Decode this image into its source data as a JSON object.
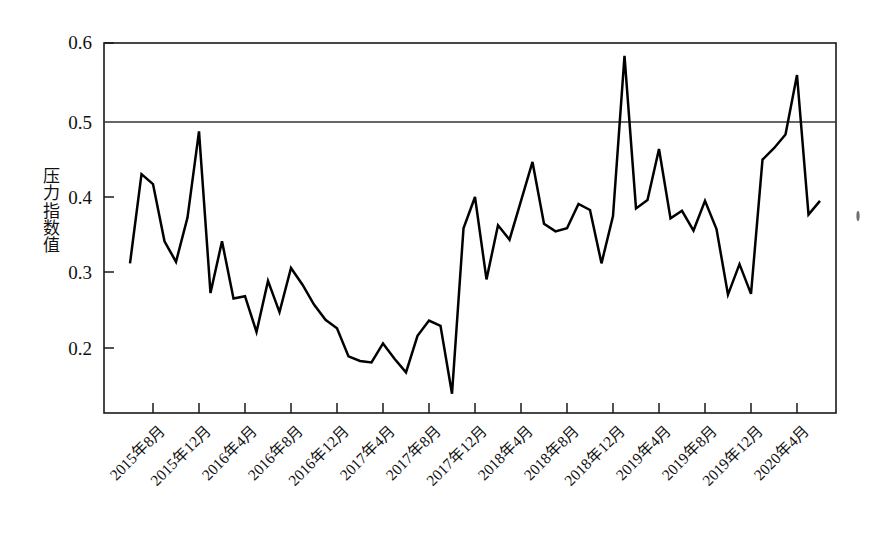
{
  "figure": {
    "background_color": "#ffffff",
    "line_color": "#000000",
    "axis_color": "#1a1a1a",
    "title": "",
    "y_caption_chars": [
      "压",
      "力",
      "指",
      "数",
      "值"
    ]
  },
  "chart_data": {
    "type": "line",
    "title": "",
    "xlabel": "",
    "ylabel": "压力指数值",
    "ylim": [
      0.125,
      0.6
    ],
    "ytick_values": [
      0.2,
      0.3,
      0.4,
      0.5,
      0.6
    ],
    "ytick_labels": [
      "0.2",
      "0.3",
      "0.4",
      "0.5",
      "0.6"
    ],
    "grid": false,
    "gridlines_drawn_at": [
      0.5
    ],
    "legend": null,
    "legend_position": "none",
    "xtick_labels": [
      "2015年8月",
      "2015年12月",
      "2016年4月",
      "2016年8月",
      "2016年12月",
      "2017年4月",
      "2017年8月",
      "2017年12月",
      "2018年4月",
      "2018年8月",
      "2018年12月",
      "2019年4月",
      "2019年8月",
      "2019年12月",
      "2020年4月"
    ],
    "xtick_indices": [
      2,
      6,
      10,
      14,
      18,
      22,
      26,
      30,
      34,
      38,
      42,
      46,
      50,
      54,
      58
    ],
    "x": [
      "2015年6月",
      "2015年7月",
      "2015年8月",
      "2015年9月",
      "2015年10月",
      "2015年11月",
      "2015年12月",
      "2016年1月",
      "2016年2月",
      "2016年3月",
      "2016年4月",
      "2016年5月",
      "2016年6月",
      "2016年7月",
      "2016年8月",
      "2016年9月",
      "2016年10月",
      "2016年11月",
      "2016年12月",
      "2017年1月",
      "2017年2月",
      "2017年3月",
      "2017年4月",
      "2017年5月",
      "2017年6月",
      "2017年7月",
      "2017年8月",
      "2017年9月",
      "2017年10月",
      "2017年11月",
      "2017年12月",
      "2018年1月",
      "2018年2月",
      "2018年3月",
      "2018年4月",
      "2018年5月",
      "2018年6月",
      "2018年7月",
      "2018年8月",
      "2018年9月",
      "2018年10月",
      "2018年11月",
      "2018年12月",
      "2019年1月",
      "2019年2月",
      "2019年3月",
      "2019年4月",
      "2019年5月",
      "2019年6月",
      "2019年7月",
      "2019年8月",
      "2019年9月",
      "2019年10月",
      "2019年11月",
      "2019年12月",
      "2020年1月",
      "2020年2月",
      "2020年3月",
      "2020年4月",
      "2020年5月",
      "2020年6月"
    ],
    "values": [
      0.311,
      0.428,
      0.415,
      0.34,
      0.313,
      0.371,
      0.484,
      0.272,
      0.34,
      0.265,
      0.268,
      0.221,
      0.288,
      0.247,
      0.305,
      0.283,
      0.257,
      0.237,
      0.226,
      0.189,
      0.183,
      0.181,
      0.206,
      0.186,
      0.168,
      0.216,
      0.236,
      0.229,
      0.14,
      0.357,
      0.398,
      0.29,
      0.361,
      0.342,
      0.393,
      0.444,
      0.363,
      0.353,
      0.357,
      0.389,
      0.381,
      0.311,
      0.373,
      0.583,
      0.383,
      0.394,
      0.461,
      0.37,
      0.38,
      0.354,
      0.393,
      0.356,
      0.27,
      0.31,
      0.271,
      0.447,
      0.462,
      0.48,
      0.558,
      0.375,
      0.393
    ],
    "series": [
      {
        "name": "压力指数值",
        "color": "#000000",
        "values": [
          0.311,
          0.428,
          0.415,
          0.34,
          0.313,
          0.371,
          0.484,
          0.272,
          0.34,
          0.265,
          0.268,
          0.221,
          0.288,
          0.247,
          0.305,
          0.283,
          0.257,
          0.237,
          0.226,
          0.189,
          0.183,
          0.181,
          0.206,
          0.186,
          0.168,
          0.216,
          0.236,
          0.229,
          0.14,
          0.357,
          0.398,
          0.29,
          0.361,
          0.342,
          0.393,
          0.444,
          0.363,
          0.353,
          0.357,
          0.389,
          0.381,
          0.311,
          0.373,
          0.583,
          0.383,
          0.394,
          0.461,
          0.37,
          0.38,
          0.354,
          0.393,
          0.356,
          0.27,
          0.31,
          0.271,
          0.447,
          0.462,
          0.48,
          0.558,
          0.375,
          0.393
        ]
      }
    ],
    "annotations": [
      {
        "note": "reference line",
        "y": 0.5
      }
    ],
    "max_value": 0.583,
    "max_at": "2019年1月",
    "min_value": 0.14,
    "min_at": "2017年10月"
  }
}
